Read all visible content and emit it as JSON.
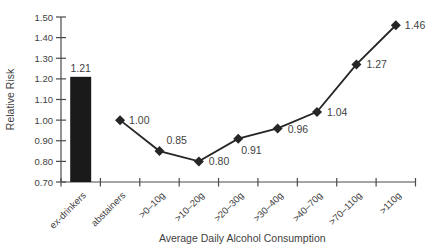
{
  "chart_data": {
    "type": "bar+line",
    "title": "",
    "xlabel": "Average Daily Alcohol Consumption",
    "ylabel": "Relative Risk",
    "ylim": [
      0.7,
      1.5
    ],
    "ytick_step": 0.1,
    "yticks": [
      "0.70",
      "0.80",
      "0.90",
      "1.00",
      "1.10",
      "1.20",
      "1.30",
      "1.40",
      "1.50"
    ],
    "grid": false,
    "legend": "none",
    "data_labels": true,
    "categories": [
      "ex-drinkers",
      "abstainers",
      ">0–10g",
      ">10–20g",
      ">20–30g",
      ">30–40g",
      ">40–70g",
      ">70–110g",
      ">110g"
    ],
    "series": [
      {
        "name": "ex-drinkers (bar)",
        "type": "bar",
        "values": [
          1.21,
          null,
          null,
          null,
          null,
          null,
          null,
          null,
          null
        ]
      },
      {
        "name": "relative risk by consumption (line)",
        "type": "line",
        "marker": "diamond",
        "values": [
          null,
          1.0,
          0.85,
          0.8,
          0.91,
          0.96,
          1.04,
          1.27,
          1.46
        ]
      }
    ],
    "point_labels": [
      "1.21",
      "1.00",
      "0.85",
      "0.80",
      "0.91",
      "0.96",
      "1.04",
      "1.27",
      "1.46"
    ]
  },
  "colors": {
    "background": "#ffffff",
    "bar": "#1a1a1a",
    "line": "#262626",
    "marker": "#262626",
    "axis": "#4a4a4a",
    "text": "#3f3f3f"
  }
}
